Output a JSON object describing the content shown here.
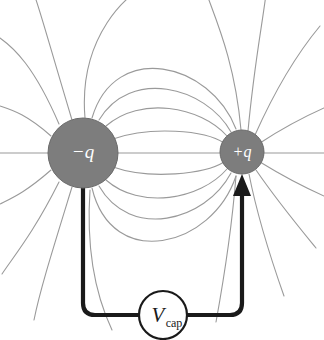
{
  "figure": {
    "canvas": {
      "width": 324,
      "height": 340,
      "background": "#ffffff"
    }
  },
  "charges": [
    {
      "id": "negative-charge",
      "label": "−q",
      "sign": "negative",
      "cx": 83,
      "cy": 153,
      "r": 35,
      "fill": "#7d7d7d",
      "stroke": "#6a6a6a",
      "label_color": "#ffffff",
      "label_font_size": 19
    },
    {
      "id": "positive-charge",
      "label": "+q",
      "sign": "positive",
      "cx": 242,
      "cy": 152,
      "r": 22,
      "fill": "#7d7d7d",
      "stroke": "#6a6a6a",
      "label_color": "#ffffff",
      "label_font_size": 16
    }
  ],
  "field_lines": {
    "color": "#9a9a9a",
    "width": 1.1,
    "description": "Dipole electric field lines running from the positive charge to the negative charge, plus radial stubs leaving the frame"
  },
  "circuit": {
    "color": "#1a1a1a",
    "width": 4.2,
    "left_wire_x": 83,
    "right_wire_x": 242,
    "bottom_wire_y": 315,
    "corner_radius": 12,
    "arrow": {
      "name": "current-arrow",
      "tip_x": 242,
      "tip_y": 176,
      "direction": "up",
      "half_width": 9,
      "length": 22
    },
    "source": {
      "name": "voltage-source",
      "cx": 163,
      "cy": 315,
      "r": 24,
      "fill": "#ffffff",
      "stroke": "#1a1a1a",
      "stroke_width": 2.2,
      "label_main": "V",
      "label_sub": "cap",
      "label_main_font_size": 21,
      "label_sub_font_size": 12
    }
  },
  "axis": {
    "name": "horizontal-axis-line",
    "y": 153,
    "x1": 0,
    "x2": 324,
    "color": "#9a9a9a"
  }
}
